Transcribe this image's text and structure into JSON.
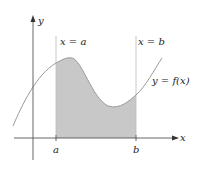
{
  "diagram": {
    "type": "definite-integral-area",
    "axes": {
      "x_label": "x",
      "y_label": "y"
    },
    "bounds": {
      "left_line_label": "x = a",
      "right_line_label": "x = b",
      "left_tick_label": "a",
      "right_tick_label": "b"
    },
    "curve_label": "y = f(x)",
    "colors": {
      "shade": "#c8c8c8",
      "curve": "#9a9a9a",
      "axis": "#555555",
      "guide_line": "#bbbbbb"
    }
  }
}
